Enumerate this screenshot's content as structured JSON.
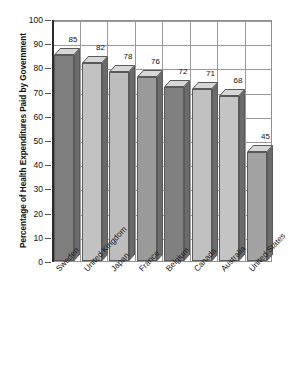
{
  "chart_data": {
    "type": "bar",
    "title": "",
    "subtitle": "",
    "xlabel": "",
    "ylabel": "Percentage of Health Expenditures Paid by Government",
    "ylim": [
      0,
      100
    ],
    "ytick_step": 10,
    "yticks": [
      "100",
      "90",
      "80",
      "70",
      "60",
      "50",
      "40",
      "30",
      "20",
      "10",
      "0"
    ],
    "categories": [
      "Sweden",
      "United Kingdom",
      "Japan",
      "France",
      "Belgium",
      "Canada",
      "Australia",
      "United States"
    ],
    "values": [
      85,
      82,
      78,
      76,
      72,
      71,
      68,
      45
    ],
    "value_labels": [
      "85",
      "82",
      "78",
      "76",
      "72",
      "71",
      "68",
      "45"
    ],
    "grid": "both",
    "legend": "none",
    "three_d": true,
    "bar_colors": [
      "#7e7e7e",
      "#c2c2c2",
      "#bdbdbd",
      "#9a9a9a",
      "#808080",
      "#c0c0c0",
      "#c4c4c4",
      "#a3a3a3"
    ],
    "bar_top_color": "#d7d7d7",
    "bar_side_color": "#6b6b6b",
    "grid_color": "#9a9a9a",
    "axis_color": "#2b2b2b",
    "background": "#ffffff",
    "text_color": "#111111"
  }
}
